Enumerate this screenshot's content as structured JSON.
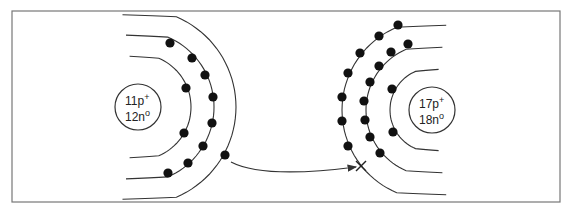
{
  "diagram": {
    "type": "ionic-bond-electron-transfer",
    "frame": {
      "x": 12,
      "y": 11,
      "w": 548,
      "h": 191
    },
    "colors": {
      "line": "#333333",
      "electron": "#111111",
      "frame": "#777777",
      "background": "#ffffff"
    },
    "left_atom": {
      "nucleus": {
        "cx": 138,
        "cy": 107,
        "r": 23,
        "protons": "11p",
        "proton_sign": "+",
        "neutrons": "12n",
        "neutron_sign": "o"
      },
      "shells": [
        {
          "r": 53,
          "electrons": [
            [
              186,
              88
            ],
            [
              184,
              133
            ]
          ]
        },
        {
          "r": 76,
          "electrons": [
            [
              170,
              43
            ],
            [
              192,
              58
            ],
            [
              205,
              75
            ],
            [
              213,
              97
            ],
            [
              212,
              123
            ],
            [
              203,
              146
            ],
            [
              188,
              163
            ],
            [
              168,
              173
            ]
          ]
        },
        {
          "r": 98,
          "electrons": [
            [
              225,
              155
            ]
          ]
        }
      ]
    },
    "right_atom": {
      "nucleus": {
        "cx": 432,
        "cy": 110,
        "r": 23,
        "protons": "17p",
        "proton_sign": "+",
        "neutrons": "18n",
        "neutron_sign": "o"
      },
      "shells": [
        {
          "r": 42,
          "electrons": [
            [
              392,
              89
            ],
            [
              393,
              132
            ]
          ]
        },
        {
          "r": 66,
          "electrons": [
            [
              408,
              44
            ],
            [
              391,
              52
            ],
            [
              379,
              66
            ],
            [
              370,
              82
            ],
            [
              364,
              101
            ],
            [
              365,
              120
            ],
            [
              370,
              137
            ],
            [
              380,
              153
            ]
          ]
        },
        {
          "r": 90,
          "electrons": [
            [
              398,
              25
            ],
            [
              379,
              36
            ],
            [
              360,
              53
            ],
            [
              348,
              73
            ],
            [
              342,
              97
            ],
            [
              342,
              121
            ],
            [
              348,
              146
            ]
          ]
        }
      ]
    },
    "transfer_arrow": {
      "from": [
        231,
        162
      ],
      "to": [
        356,
        167
      ],
      "target_marker": "x",
      "marker_pos": [
        361,
        166
      ]
    }
  }
}
